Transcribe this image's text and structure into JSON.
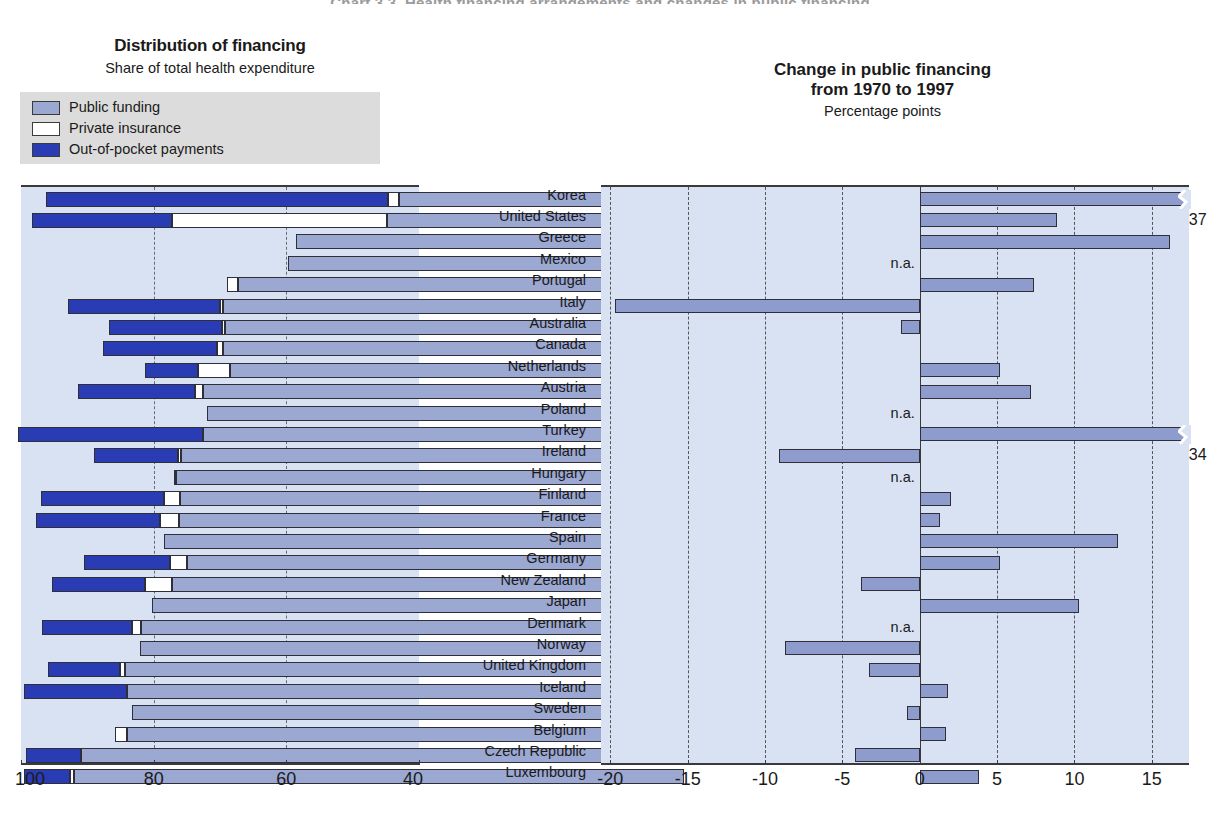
{
  "page": {
    "top_title_faint": "Chart 3.3.  Health financing arrangements and changes in public financing"
  },
  "left_panel": {
    "title": "Distribution of financing",
    "subtitle": "Share of total health expenditure",
    "legend": [
      {
        "label": "Public funding",
        "color": "#9aa8d2",
        "key": "public"
      },
      {
        "label": "Private insurance",
        "color": "#ffffff",
        "key": "private"
      },
      {
        "label": "Out-of-pocket payments",
        "color": "#2a3cb4",
        "key": "oop"
      }
    ],
    "axis": {
      "ticks": [
        100,
        80,
        60,
        40
      ],
      "tick_labels": [
        "100",
        "80",
        "60",
        "40"
      ],
      "min": 40,
      "max": 100,
      "reversed": true
    }
  },
  "right_panel": {
    "title_line1": "Change in public financing",
    "title_line2": "from 1970 to 1997",
    "subtitle": "Percentage points",
    "axis": {
      "ticks": [
        -20,
        -15,
        -10,
        -5,
        0,
        5,
        10,
        15
      ],
      "tick_labels": [
        "-20",
        "-15",
        "-10",
        "-5",
        "0",
        "5",
        "10",
        "15"
      ],
      "min": -20.6,
      "max": 17.4
    },
    "na_label": "n.a.",
    "break_value_labels": {
      "Korea": "37",
      "Turkey": "34"
    }
  },
  "countries": [
    "Korea",
    "United States",
    "Greece",
    "Mexico",
    "Portugal",
    "Italy",
    "Australia",
    "Canada",
    "Netherlands",
    "Austria",
    "Poland",
    "Turkey",
    "Ireland",
    "Hungary",
    "Finland",
    "France",
    "Spain",
    "Germany",
    "New Zealand",
    "Japan",
    "Denmark",
    "Norway",
    "United Kingdom",
    "Iceland",
    "Sweden",
    "Belgium",
    "Czech Republic",
    "Luxembourg"
  ],
  "chart_data": [
    {
      "type": "bar",
      "orientation": "horizontal",
      "stacked": true,
      "title": "Distribution of financing",
      "subtitle": "Share of total health expenditure",
      "xlabel": "",
      "ylabel": "",
      "xlim": [
        100,
        40
      ],
      "xticks": [
        100,
        80,
        60,
        40
      ],
      "grid": "dashed vertical at 80 and 60",
      "legend_position": "top-left",
      "note": "Bars are drawn from the right edge (40) leftwards; total bar length = 100 minus private-out-of-pocket share. Segments ordered right-to-left: public funding, private insurance, out-of-pocket payments.",
      "categories": [
        "Korea",
        "United States",
        "Greece",
        "Mexico",
        "Portugal",
        "Italy",
        "Australia",
        "Canada",
        "Netherlands",
        "Austria",
        "Poland",
        "Turkey",
        "Ireland",
        "Hungary",
        "Finland",
        "France",
        "Spain",
        "Germany",
        "New Zealand",
        "Japan",
        "Denmark",
        "Norway",
        "United Kingdom",
        "Iceland",
        "Sweden",
        "Belgium",
        "Czech Republic",
        "Luxembourg"
      ],
      "series": [
        {
          "name": "Public funding",
          "values": [
            43.0,
            44.8,
            58.5,
            59.8,
            67.3,
            69.6,
            69.3,
            69.5,
            68.5,
            72.5,
            72.0,
            72.5,
            75.9,
            76.6,
            76.0,
            76.2,
            78.5,
            74.9,
            77.2,
            80.2,
            81.9,
            82.1,
            84.3,
            84.0,
            83.3,
            84.0,
            91.0,
            92.0
          ]
        },
        {
          "name": "Private insurance",
          "values": [
            1.7,
            32.4,
            0.0,
            0.0,
            1.7,
            0.4,
            0.4,
            0.9,
            4.8,
            1.2,
            0.0,
            0.0,
            0.4,
            0.3,
            2.4,
            2.8,
            0.0,
            2.7,
            4.1,
            0.0,
            1.4,
            0.0,
            0.8,
            0.0,
            0.0,
            1.9,
            0.0,
            0.6
          ]
        },
        {
          "name": "Out-of-pocket payments",
          "values": [
            51.5,
            21.1,
            0.0,
            0.0,
            0.0,
            22.9,
            17.1,
            17.3,
            8.0,
            17.7,
            0.0,
            28.0,
            12.7,
            0.0,
            18.6,
            18.8,
            0.0,
            12.9,
            14.0,
            0.0,
            13.5,
            0.0,
            10.9,
            15.5,
            0.0,
            0.0,
            8.3,
            6.9
          ]
        }
      ]
    },
    {
      "type": "bar",
      "orientation": "horizontal",
      "title": "Change in public financing from 1970 to 1997",
      "subtitle": "Percentage points",
      "xlabel": "",
      "ylabel": "",
      "xlim": [
        -20.6,
        17.4
      ],
      "xticks": [
        -20,
        -15,
        -10,
        -5,
        0,
        5,
        10,
        15
      ],
      "grid": "dashed vertical gridlines at each tick, solid at 0",
      "legend_position": "none",
      "categories": [
        "Korea",
        "United States",
        "Greece",
        "Mexico",
        "Portugal",
        "Italy",
        "Australia",
        "Canada",
        "Netherlands",
        "Austria",
        "Poland",
        "Turkey",
        "Ireland",
        "Hungary",
        "Finland",
        "France",
        "Spain",
        "Germany",
        "New Zealand",
        "Japan",
        "Denmark",
        "Norway",
        "United Kingdom",
        "Iceland",
        "Sweden",
        "Belgium",
        "Czech Republic",
        "Luxembourg"
      ],
      "values": [
        37.0,
        8.9,
        16.2,
        null,
        7.4,
        -19.7,
        -1.2,
        0.0,
        5.2,
        7.2,
        null,
        34.0,
        -9.1,
        null,
        2.0,
        1.3,
        12.8,
        5.2,
        -3.8,
        10.3,
        null,
        -8.7,
        -3.3,
        1.8,
        -0.8,
        1.7,
        -4.2,
        3.8
      ],
      "broken_bars": [
        {
          "category": "Korea",
          "value": 37.0,
          "label": "37"
        },
        {
          "category": "Turkey",
          "value": 34.0,
          "label": "34"
        }
      ],
      "missing": [
        "Mexico",
        "Poland",
        "Hungary",
        "Denmark"
      ],
      "missing_label": "n.a."
    }
  ]
}
